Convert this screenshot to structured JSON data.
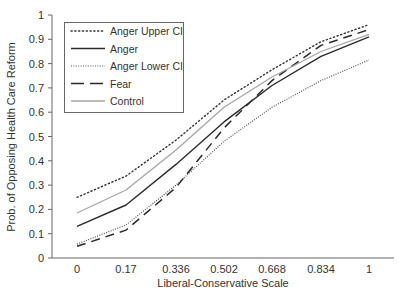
{
  "chart_data": {
    "type": "line",
    "title": "",
    "xlabel": "Liberal-Conservative Scale",
    "ylabel": "Prob. of Opposing Health Care Reform",
    "x": [
      0,
      0.17,
      0.336,
      0.502,
      0.668,
      0.834,
      1
    ],
    "x_tick_labels": [
      "0",
      "0.17",
      "0.336",
      "0.502",
      "0.668",
      "0.834",
      "1"
    ],
    "y_ticks": [
      0,
      0.1,
      0.2,
      0.3,
      0.4,
      0.5,
      0.6,
      0.7,
      0.8,
      0.9,
      1
    ],
    "y_tick_labels": [
      "0",
      "0.1",
      "0.2",
      "0.3",
      "0.4",
      "0.5",
      "0.6",
      "0.7",
      "0.8",
      "0.9",
      "1"
    ],
    "ylim": [
      0,
      1
    ],
    "grid": false,
    "legend_position": "upper left",
    "series": [
      {
        "name": "Anger Upper CI",
        "style": "dotted",
        "color": "#333333",
        "values": [
          0.25,
          0.337,
          0.485,
          0.65,
          0.775,
          0.89,
          0.96
        ]
      },
      {
        "name": "Anger",
        "style": "solid",
        "color": "#2b2b2b",
        "values": [
          0.13,
          0.218,
          0.385,
          0.56,
          0.71,
          0.83,
          0.91
        ]
      },
      {
        "name": "Anger Lower CI",
        "style": "dotted-fine",
        "color": "#555555",
        "values": [
          0.057,
          0.136,
          0.3,
          0.48,
          0.62,
          0.73,
          0.815
        ]
      },
      {
        "name": "Fear",
        "style": "dashed",
        "color": "#2b2b2b",
        "values": [
          0.048,
          0.115,
          0.29,
          0.535,
          0.73,
          0.875,
          0.94
        ]
      },
      {
        "name": "Control",
        "style": "solid-light",
        "color": "#a0a0a0",
        "values": [
          0.185,
          0.28,
          0.445,
          0.62,
          0.745,
          0.85,
          0.92
        ]
      }
    ]
  }
}
